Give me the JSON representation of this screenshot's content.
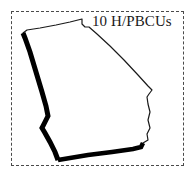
{
  "figure": {
    "background_color": "#ffffff"
  },
  "frame": {
    "style": "dashed",
    "color": "#4a4a4a"
  },
  "label": {
    "text": "10 H/PBCUs",
    "count": "10",
    "unit": "H/PBCUs",
    "color": "#1a1a1a"
  },
  "map": {
    "region_name": "Georgia",
    "fill_color": "#ffffff",
    "thin_outline_color": "#1a1a1a",
    "thick_outline_color": "#000000",
    "thin_outline_width": 1.2,
    "thick_outline_width": 5,
    "outline_path": "M 23 33 L 27 30 L 40 28 L 56 25 L 70 22 L 82 19 L 82 24 L 85 27 L 89 27 L 97 34 L 110 46 L 124 60 L 138 75 L 148 86 L 152 90 L 149 94 L 147 97 L 148 104 L 150 112 L 148 120 L 150 128 L 147 134 L 148 140 L 143 143 L 141 147 L 133 149 L 112 152 L 88 155 L 70 158 L 58 160 L 55 152 L 50 142 L 45 133 L 42 128 L 45 122 L 48 116 L 46 106 L 42 92 L 36 72 L 30 52 L 25 38 Z",
    "thick_west_path": "M 23 33 L 25 38 L 30 52 L 36 72 L 42 92 L 46 106 L 48 116 L 45 122 L 42 128 L 45 133 L 50 142 L 55 152 L 58 160",
    "thick_south_path": "M 58 160 L 70 158 L 88 155 L 112 152 L 133 149 L 141 147 L 143 143"
  }
}
